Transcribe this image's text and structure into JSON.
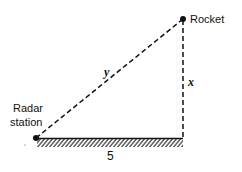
{
  "diagram": {
    "points": {
      "radar": {
        "label_line1": "Radar",
        "label_line2": "station"
      },
      "rocket": {
        "label": "Rocket"
      }
    },
    "segments": {
      "hypotenuse_label": "y",
      "vertical_label": "x",
      "ground_label": "5"
    },
    "colors": {
      "ink": "#111111",
      "background": "#ffffff"
    }
  }
}
